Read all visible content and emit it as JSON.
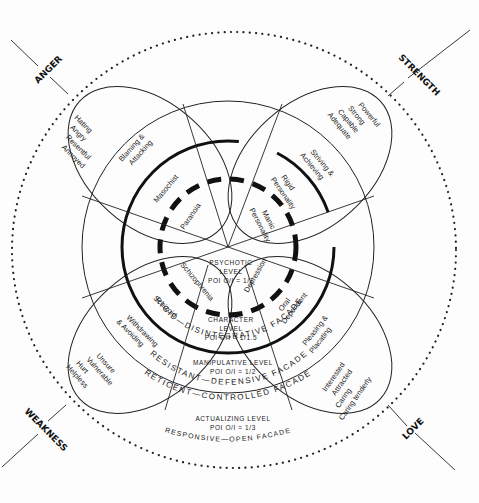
{
  "diagram": {
    "colors": {
      "ink": "#111111",
      "background": "#fdfdfd"
    },
    "corners": {
      "top_left": "ANGER",
      "top_right": "STRENGTH",
      "bottom_left": "WEAKNESS",
      "bottom_right": "LOVE"
    },
    "petals": {
      "anger": {
        "outer": [
          "Hating",
          "Angry",
          "Resentful",
          "Annoyed"
        ],
        "middle": [
          "Blaming &",
          "Attacking"
        ],
        "inner": "Masochist",
        "core": "Paranoia"
      },
      "strength": {
        "outer": [
          "Powerful",
          "Strong",
          "Capable",
          "Adequate"
        ],
        "middle": [
          "Striving &",
          "Achieving"
        ],
        "inner": [
          "Rigid",
          "Personality"
        ],
        "core": [
          "Manic",
          "Personality"
        ]
      },
      "weakness": {
        "outer": [
          "Unsure",
          "Vulnerable",
          "Hurt",
          "Helpless"
        ],
        "middle": [
          "Withdrawing",
          "& Avoiding"
        ],
        "inner": "Schizoid",
        "core": "Schizophrenia"
      },
      "love": {
        "outer": [
          "Interested",
          "Attracted",
          "Caring",
          "Caring tenderly"
        ],
        "middle": [
          "Pleasing &",
          "Placating"
        ],
        "inner": [
          "Oral",
          "Dependent"
        ],
        "core": "Depression"
      }
    },
    "levels": [
      {
        "name": "PSYCHOTIC",
        "name2": "LEVEL",
        "poi": "POI O/I = 1/1"
      },
      {
        "name": "CHARACTER",
        "name2": "LEVEL",
        "poi": "POI O/I = 1/1.5"
      },
      {
        "name": "MANIPULATIVE LEVEL",
        "poi": "POI O/I = 1/2"
      },
      {
        "name": "ACTUALIZING LEVEL",
        "poi": "POI O/I = 1/3"
      }
    ],
    "facades": {
      "rigid": "RIGID—DISINTEGRATIVE FACADE",
      "resistant": "RESISTANT—DEFENSIVE FACADE",
      "reticent": "RETICENT—CONTROLLED FACADE",
      "responsive": "RESPONSIVE—OPEN FACADE"
    }
  }
}
